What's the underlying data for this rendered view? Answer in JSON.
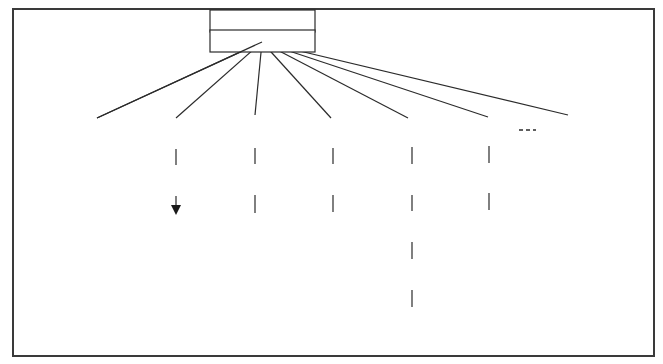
{
  "diagram": {
    "type": "tree",
    "root": {
      "id": "root",
      "label": "Cutting tool material"
    },
    "categories": [
      {
        "id": "hss",
        "label": "HSS",
        "children": []
      },
      {
        "id": "carbide",
        "label": "Carbide",
        "children": [
          {
            "id": "c1",
            "label": "C1"
          },
          {
            "id": "c19",
            "label": "C19"
          }
        ],
        "note": "arrow from C1 to C19"
      },
      {
        "id": "coated",
        "label_line1": "Coated",
        "label_line2": "carbide",
        "children": [
          {
            "id": "tic",
            "label": "TiC"
          },
          {
            "id": "tin",
            "label": "TiN"
          }
        ]
      },
      {
        "id": "ceramics",
        "label": "Ceramics",
        "children": [
          {
            "id": "al2o3",
            "label": "Al2O3",
            "parts": [
              "Al",
              "2",
              "O",
              "3"
            ]
          },
          {
            "id": "si3n4",
            "label": "Si3N4",
            "parts": [
              "Si",
              "3",
              "N",
              "4"
            ]
          }
        ]
      },
      {
        "id": "cermet",
        "label": "Cermet",
        "children": [
          {
            "id": "cer1",
            "label": "1."
          },
          {
            "id": "cer2",
            "label": "2."
          },
          {
            "id": "cer3",
            "label": "3."
          },
          {
            "id": "cer4",
            "label": "4."
          }
        ]
      },
      {
        "id": "diamond",
        "label": "Diamond",
        "children": [
          {
            "id": "pcd",
            "label": "PCD"
          },
          {
            "id": "natural",
            "label_line1": "Natural",
            "label_line2": "diamond"
          }
        ]
      },
      {
        "id": "borazon",
        "label": "Borazon",
        "children": [],
        "note": "dashed link to Diamond"
      }
    ]
  }
}
